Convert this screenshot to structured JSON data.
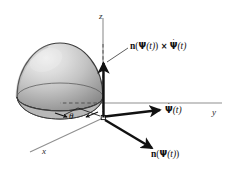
{
  "figure": {
    "type": "technical-diagram",
    "background_color": "#ffffff",
    "size": {
      "width": 228,
      "height": 176
    }
  },
  "axes": [
    {
      "id": "z",
      "label": "z",
      "direction": "vertical-up",
      "line_color": "#8a8a8a"
    },
    {
      "id": "y",
      "label": "y",
      "direction": "horizontal-right",
      "line_color": "#8a8a8a"
    },
    {
      "id": "x",
      "label": "x",
      "direction": "diagonal-lower-left",
      "line_color": "#8a8a8a"
    }
  ],
  "angle": {
    "symbol": "θ",
    "name": "theta",
    "description": "azimuthal angle at the base of the hemisphere between the x-axis and the vector base point"
  },
  "surface": {
    "name": "hemisphere",
    "shading": "gray-gradient",
    "fill_light": "#e6e6e6",
    "fill_mid": "#b8b8b8",
    "fill_dark": "#7d7d7d",
    "edge_color": "#3a3a3a"
  },
  "vectors": [
    {
      "id": "cross-product",
      "label_parts": {
        "n": "n",
        "open": "(",
        "psi": "Ψ",
        "arg": "(t)",
        "close": ")",
        "cross": "×",
        "psidot": "Ψ",
        "dot": "˙",
        "arg2": "(t)"
      },
      "label_text": "n(Ψ(t)) × Ψ̇(t)",
      "direction": "up (normal to tangent plane)",
      "color": "#111111"
    },
    {
      "id": "psi-dot",
      "label_parts": {
        "psidot": "Ψ",
        "dot": "˙",
        "arg": "(t)"
      },
      "label_text": "Ψ̇(t)",
      "direction": "right (tangent / velocity)",
      "color": "#111111"
    },
    {
      "id": "surface-normal",
      "label_parts": {
        "n": "n",
        "open": "(",
        "psi": "Ψ",
        "arg": "(t)",
        "close": ")"
      },
      "label_text": "n(Ψ(t))",
      "direction": "lower-right (outward surface normal)",
      "color": "#111111"
    }
  ],
  "origin_marker": {
    "name": "base-point",
    "description": "small open square marking the point Ψ(t) on the equator"
  }
}
